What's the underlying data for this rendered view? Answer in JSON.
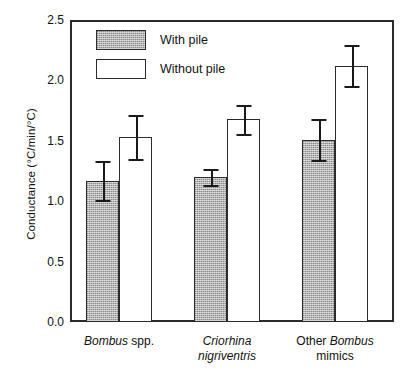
{
  "chart_data": {
    "type": "bar",
    "title": "",
    "xlabel": "",
    "ylabel": "Conductance (°C/min/°C)",
    "ylim": [
      0.0,
      2.5
    ],
    "ytick_labels": [
      "0.0",
      "0.5",
      "1.0",
      "1.5",
      "2.0",
      "2.5"
    ],
    "ytick_values": [
      0.0,
      0.5,
      1.0,
      1.5,
      2.0,
      2.5
    ],
    "grid": false,
    "legend_position": "upper-left-inside",
    "categories": [
      "Bombus spp.",
      "Criorhina nigriventris",
      "Other Bombus mimics"
    ],
    "category_label_parts": [
      [
        {
          "text": "Bombus",
          "italic": true
        },
        {
          "text": " spp.",
          "italic": false
        }
      ],
      [
        {
          "text": "Criorhina",
          "italic": true
        },
        {
          "text": "nigriventris",
          "italic": true
        }
      ],
      [
        {
          "text": "Other ",
          "italic": false
        },
        {
          "text": "Bombus",
          "italic": true
        },
        {
          "text": "mimics",
          "italic": false
        }
      ]
    ],
    "series": [
      {
        "name": "With pile",
        "fill": "shaded-gray",
        "color": "#a9a9a9",
        "values": [
          1.17,
          1.2,
          1.51
        ],
        "errors": [
          0.16,
          0.07,
          0.17
        ]
      },
      {
        "name": "Without pile",
        "fill": "white",
        "color": "#ffffff",
        "values": [
          1.53,
          1.68,
          2.12
        ],
        "errors": [
          0.18,
          0.12,
          0.17
        ]
      }
    ]
  },
  "legend": {
    "items": [
      {
        "label": "With pile",
        "style": "filled"
      },
      {
        "label": "Without pile",
        "style": "open"
      }
    ]
  },
  "axis": {
    "y_title": "Conductance (°C/min/°C)"
  }
}
